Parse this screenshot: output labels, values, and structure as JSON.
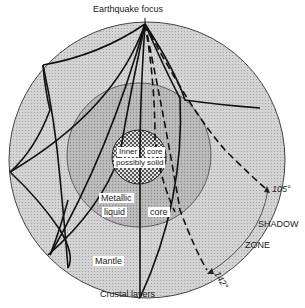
{
  "title": "Earthquake focus",
  "layers": {
    "inner_core": [
      "Inner",
      "core",
      "possibly",
      "solid"
    ],
    "outer_core": [
      "Metallic",
      "liquid",
      "core"
    ],
    "mantle": "Mantle",
    "crust": "Crustal layers"
  },
  "shadow_zone": {
    "start_angle": "105°",
    "end_angle": "142°",
    "label_1": "SHADOW",
    "label_2": "ZONE"
  },
  "colors": {
    "mantle_fill": "#cfcfcf",
    "outer_core_fill": "#b5b5b5",
    "inner_core_fill": "#9a9a9a",
    "ray_line": "#111111",
    "outline": "#333333"
  }
}
